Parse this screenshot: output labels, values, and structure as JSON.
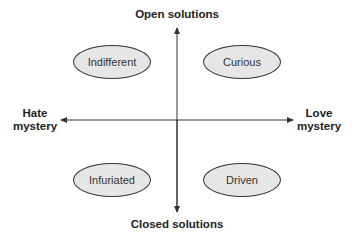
{
  "axes": {
    "top": "Open solutions",
    "bottom": "Closed solutions",
    "left": [
      "Hate",
      "mystery"
    ],
    "right": [
      "Love",
      "mystery"
    ]
  },
  "quadrants": {
    "top_left": "Indifferent",
    "top_right": "Curious",
    "bottom_left": "Infuriated",
    "bottom_right": "Driven"
  },
  "colors": {
    "ellipse_fill": "#e6e6e6",
    "stroke": "#333333"
  }
}
